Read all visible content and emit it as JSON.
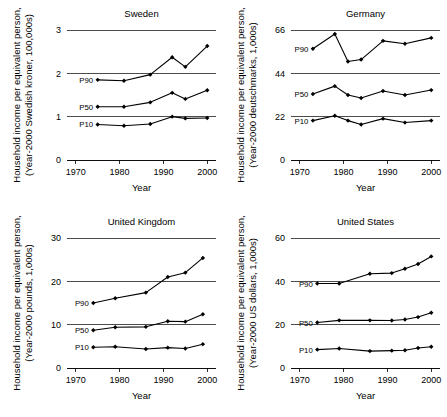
{
  "figure": {
    "axis_x_title": "Year",
    "panel_count": 4
  },
  "chart_data": [
    {
      "type": "line",
      "title": "Sweden",
      "xlabel": "Year",
      "ylabel": "Household income per equivalent person, (Year-2000 Swedish kroner, 100,000s)",
      "ylabel_line1": "Household income per equivalent person,",
      "ylabel_line2": "(Year-2000 Swedish kroner, 100,000s)",
      "xlim": [
        1968,
        2002
      ],
      "ylim": [
        0,
        3
      ],
      "xticks": [
        1970,
        1980,
        1990,
        2000
      ],
      "yticks": [
        0,
        1,
        2,
        3
      ],
      "grid": "horizontal",
      "legend_position": "inline-left",
      "series": [
        {
          "name": "P90",
          "x": [
            1975,
            1981,
            1987,
            1992,
            1995,
            2000
          ],
          "values": [
            1.85,
            1.83,
            1.97,
            2.37,
            2.15,
            2.63
          ]
        },
        {
          "name": "P50",
          "x": [
            1975,
            1981,
            1987,
            1992,
            1995,
            2000
          ],
          "values": [
            1.23,
            1.23,
            1.33,
            1.55,
            1.41,
            1.61
          ]
        },
        {
          "name": "P10",
          "x": [
            1975,
            1981,
            1987,
            1992,
            1995,
            2000
          ],
          "values": [
            0.82,
            0.79,
            0.83,
            1.0,
            0.96,
            0.97
          ]
        }
      ]
    },
    {
      "type": "line",
      "title": "Germany",
      "xlabel": "Year",
      "ylabel": "Household income per equivalent person, (Year-2000 deutschmarks, 1,000s)",
      "ylabel_line1": "Household income per equivalent person,",
      "ylabel_line2": "(Year-2000 deutschmarks, 1,000s)",
      "xlim": [
        1968,
        2002
      ],
      "ylim": [
        0,
        66
      ],
      "xticks": [
        1970,
        1980,
        1990,
        2000
      ],
      "yticks": [
        0,
        22,
        44,
        66
      ],
      "grid": "horizontal",
      "legend_position": "inline-left",
      "series": [
        {
          "name": "P90",
          "x": [
            1973,
            1978,
            1981,
            1984,
            1989,
            1994,
            2000
          ],
          "values": [
            56.5,
            64.0,
            50.0,
            51.0,
            60.5,
            59.0,
            62.0
          ]
        },
        {
          "name": "P50",
          "x": [
            1973,
            1978,
            1981,
            1984,
            1989,
            1994,
            2000
          ],
          "values": [
            33.5,
            37.5,
            33.0,
            31.5,
            35.0,
            33.0,
            35.5
          ]
        },
        {
          "name": "P10",
          "x": [
            1973,
            1978,
            1981,
            1984,
            1989,
            1994,
            2000
          ],
          "values": [
            20.0,
            22.5,
            20.0,
            18.0,
            21.0,
            19.0,
            20.0
          ]
        }
      ]
    },
    {
      "type": "line",
      "title": "United Kingdom",
      "xlabel": "Year",
      "ylabel": "Household income per equivalent person, (Year-2000 pounds, 1,000s)",
      "ylabel_line1": "Household income per equivalent person,",
      "ylabel_line2": "(Year-2000 pounds, 1,000s)",
      "xlim": [
        1968,
        2002
      ],
      "ylim": [
        0,
        30
      ],
      "xticks": [
        1970,
        1980,
        1990,
        2000
      ],
      "yticks": [
        0,
        10,
        20,
        30
      ],
      "grid": "horizontal",
      "legend_position": "inline-left",
      "series": [
        {
          "name": "P90",
          "x": [
            1974,
            1979,
            1986,
            1991,
            1995,
            1999
          ],
          "values": [
            15.0,
            16.1,
            17.4,
            21.0,
            22.0,
            25.4
          ]
        },
        {
          "name": "P50",
          "x": [
            1974,
            1979,
            1986,
            1991,
            1995,
            1999
          ],
          "values": [
            8.7,
            9.4,
            9.5,
            10.8,
            10.7,
            12.4
          ]
        },
        {
          "name": "P10",
          "x": [
            1974,
            1979,
            1986,
            1991,
            1995,
            1999
          ],
          "values": [
            4.8,
            4.9,
            4.4,
            4.7,
            4.5,
            5.5
          ]
        }
      ]
    },
    {
      "type": "line",
      "title": "United States",
      "xlabel": "Year",
      "ylabel": "Household income per equivalent person, (Year-2000 US dollars, 1,000s)",
      "ylabel_line1": "Household income per equivalent person,",
      "ylabel_line2": "(Year-2000 US dollars, 1,000s)",
      "xlim": [
        1968,
        2002
      ],
      "ylim": [
        0,
        60
      ],
      "xticks": [
        1970,
        1980,
        1990,
        2000
      ],
      "yticks": [
        0,
        20,
        40,
        60
      ],
      "grid": "horizontal",
      "legend_position": "inline-left",
      "series": [
        {
          "name": "P90",
          "x": [
            1974,
            1979,
            1986,
            1991,
            1994,
            1997,
            2000
          ],
          "values": [
            39.0,
            39.0,
            43.5,
            43.8,
            45.8,
            48.0,
            51.5
          ]
        },
        {
          "name": "P50",
          "x": [
            1974,
            1979,
            1986,
            1991,
            1994,
            1997,
            2000
          ],
          "values": [
            21.0,
            22.0,
            22.0,
            21.9,
            22.4,
            23.5,
            25.5
          ]
        },
        {
          "name": "P10",
          "x": [
            1974,
            1979,
            1986,
            1991,
            1994,
            1997,
            2000
          ],
          "values": [
            8.5,
            9.0,
            7.8,
            8.0,
            8.2,
            9.2,
            9.8
          ]
        }
      ]
    }
  ]
}
